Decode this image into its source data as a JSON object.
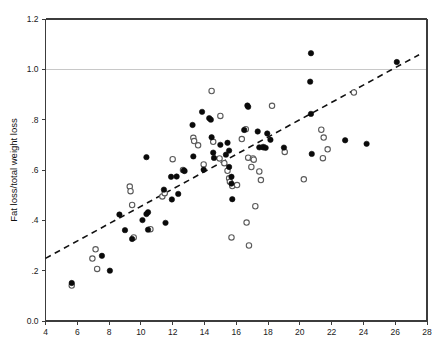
{
  "figure": {
    "title": "",
    "background_color": "#ffffff"
  },
  "chart_data": {
    "type": "scatter",
    "title": "",
    "subtitle": "",
    "xlabel": "",
    "ylabel": "Fat loss/total weight loss",
    "xlim": [
      4,
      28
    ],
    "ylim": [
      0.0,
      1.2
    ],
    "xticks": [
      4,
      6,
      8,
      10,
      12,
      14,
      16,
      18,
      20,
      22,
      24,
      26,
      28
    ],
    "xticklabels": [
      "4",
      "6",
      "8",
      "10",
      "12",
      "14",
      "16",
      "18",
      "20",
      "22",
      "24",
      "26",
      "28"
    ],
    "yticks": [
      0.0,
      0.2,
      0.4,
      0.6,
      0.8,
      1.0,
      1.2
    ],
    "yticklabels": [
      "0.0",
      ".2",
      ".4",
      ".6",
      ".8",
      "1.0",
      "1.2"
    ],
    "grid": false,
    "gridlines_y": [
      1.0
    ],
    "gridline_color": "#c8c8c8",
    "legend": null,
    "legend_position": "none",
    "annotations": [],
    "marker_colors": {
      "filled": "#0a0a0a",
      "open_edge": "#5a5a5a",
      "open_fill": "#ffffff"
    },
    "trend_line": {
      "style": "dashed",
      "color": "#111111",
      "x": [
        4.0,
        27.5
      ],
      "y": [
        0.249,
        1.058
      ]
    },
    "series": [
      {
        "name": "filled",
        "marker": "filled-circle",
        "points": [
          [
            5.65,
            0.151
          ],
          [
            7.55,
            0.259
          ],
          [
            8.05,
            0.2
          ],
          [
            8.65,
            0.423
          ],
          [
            9.0,
            0.361
          ],
          [
            9.45,
            0.326
          ],
          [
            10.1,
            0.401
          ],
          [
            10.35,
            0.651
          ],
          [
            10.35,
            0.425
          ],
          [
            10.45,
            0.432
          ],
          [
            10.45,
            0.363
          ],
          [
            11.45,
            0.522
          ],
          [
            11.55,
            0.39
          ],
          [
            11.9,
            0.573
          ],
          [
            11.95,
            0.483
          ],
          [
            12.25,
            0.574
          ],
          [
            12.35,
            0.505
          ],
          [
            12.7,
            0.598
          ],
          [
            12.75,
            0.596
          ],
          [
            13.25,
            0.779
          ],
          [
            13.3,
            0.654
          ],
          [
            13.85,
            0.831
          ],
          [
            13.95,
            0.601
          ],
          [
            14.3,
            0.806
          ],
          [
            14.4,
            0.8
          ],
          [
            14.45,
            0.73
          ],
          [
            14.55,
            0.669
          ],
          [
            14.6,
            0.648
          ],
          [
            15.0,
            0.7
          ],
          [
            15.35,
            0.661
          ],
          [
            15.45,
            0.708
          ],
          [
            15.55,
            0.677
          ],
          [
            15.55,
            0.612
          ],
          [
            15.7,
            0.573
          ],
          [
            15.7,
            0.546
          ],
          [
            15.75,
            0.484
          ],
          [
            16.7,
            0.856
          ],
          [
            16.75,
            0.851
          ],
          [
            16.5,
            0.759
          ],
          [
            17.35,
            0.753
          ],
          [
            17.45,
            0.69
          ],
          [
            17.7,
            0.69
          ],
          [
            17.85,
            0.688
          ],
          [
            17.95,
            0.745
          ],
          [
            18.15,
            0.72
          ],
          [
            19.0,
            0.689
          ],
          [
            20.7,
            1.064
          ],
          [
            20.65,
            0.951
          ],
          [
            20.7,
            0.823
          ],
          [
            20.75,
            0.664
          ],
          [
            22.85,
            0.718
          ],
          [
            24.2,
            0.704
          ],
          [
            26.1,
            1.029
          ]
        ]
      },
      {
        "name": "open",
        "marker": "open-circle",
        "points": [
          [
            5.65,
            0.141
          ],
          [
            6.95,
            0.248
          ],
          [
            7.15,
            0.285
          ],
          [
            7.25,
            0.207
          ],
          [
            9.3,
            0.534
          ],
          [
            9.35,
            0.516
          ],
          [
            9.45,
            0.461
          ],
          [
            9.55,
            0.332
          ],
          [
            10.6,
            0.365
          ],
          [
            11.35,
            0.495
          ],
          [
            11.5,
            0.508
          ],
          [
            12.0,
            0.643
          ],
          [
            12.65,
            0.6
          ],
          [
            13.3,
            0.728
          ],
          [
            13.35,
            0.715
          ],
          [
            13.6,
            0.698
          ],
          [
            13.95,
            0.622
          ],
          [
            14.45,
            0.914
          ],
          [
            14.55,
            0.712
          ],
          [
            15.0,
            0.815
          ],
          [
            14.95,
            0.646
          ],
          [
            15.25,
            0.627
          ],
          [
            15.45,
            0.597
          ],
          [
            15.55,
            0.567
          ],
          [
            15.6,
            0.553
          ],
          [
            15.75,
            0.536
          ],
          [
            15.7,
            0.332
          ],
          [
            16.05,
            0.54
          ],
          [
            16.35,
            0.723
          ],
          [
            16.6,
            0.762
          ],
          [
            16.65,
            0.391
          ],
          [
            16.75,
            0.649
          ],
          [
            16.8,
            0.3
          ],
          [
            16.95,
            0.612
          ],
          [
            17.05,
            0.646
          ],
          [
            17.1,
            0.641
          ],
          [
            17.2,
            0.456
          ],
          [
            17.45,
            0.594
          ],
          [
            17.55,
            0.56
          ],
          [
            17.7,
            0.691
          ],
          [
            18.25,
            0.855
          ],
          [
            19.05,
            0.672
          ],
          [
            20.25,
            0.563
          ],
          [
            21.35,
            0.76
          ],
          [
            21.45,
            0.647
          ],
          [
            21.5,
            0.729
          ],
          [
            21.75,
            0.682
          ],
          [
            23.4,
            0.908
          ]
        ]
      }
    ]
  }
}
